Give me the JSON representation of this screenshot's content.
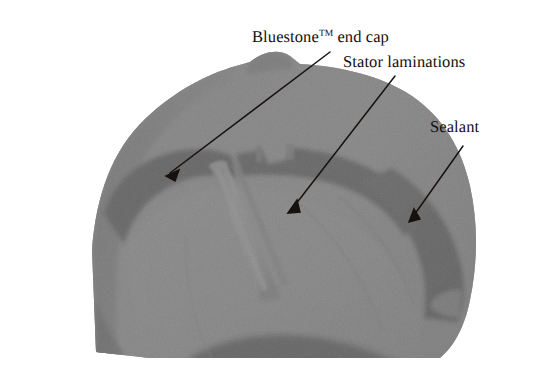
{
  "figure": {
    "kind": "annotated-photograph",
    "width": 541,
    "height": 377,
    "background_color": "#ffffff"
  },
  "annotations": {
    "bluestone": {
      "text_before": "Bluestone",
      "superscript": "TM",
      "text_after": " end cap",
      "full_text": "Bluestone™ end cap",
      "leader": {
        "x1": 330,
        "y1": 52,
        "x2": 166,
        "y2": 176,
        "arrow": "down-left"
      }
    },
    "stator": {
      "label": "Stator laminations",
      "leader": {
        "x1": 395,
        "y1": 76,
        "x2": 288,
        "y2": 213,
        "arrow": "down-left"
      }
    },
    "sealant": {
      "label": "Sealant",
      "leader": {
        "x1": 463,
        "y1": 146,
        "x2": 409,
        "y2": 222,
        "arrow": "down-left"
      }
    }
  },
  "palette": {
    "paper": "#ffffff",
    "ink": "#14100f",
    "housing_mid_gray": "#8c8c8c",
    "housing_light_gray": "#9b9b9b",
    "housing_shadow_gray": "#6f6f6f",
    "lamination_dark": "#2b2b2b",
    "sealant_dark": "#303030",
    "deep_shadow": "#1d1d1d",
    "rod_highlight": "#a6a6a6"
  },
  "regions": [
    {
      "name": "outer-housing-shell",
      "tone": "#8c8c8c",
      "description": "rounded motor housing shoulder occupying upper-left through center"
    },
    {
      "name": "upper-dark-lamination-band",
      "tone": "#2b2b2b",
      "description": "dark curved band of stator laminations across upper middle"
    },
    {
      "name": "cylindrical-rod",
      "tone": "#a6a6a6",
      "description": "light cylindrical pin running down-right through the center"
    },
    {
      "name": "lower-light-field",
      "tone": "#9b9b9b",
      "description": "large light gray rotor/stator face filling the lower middle"
    },
    {
      "name": "right-dark-sealant-mass",
      "tone": "#303030",
      "description": "dark sealant wedge on the right side"
    },
    {
      "name": "left-shadow-edge",
      "tone": "#6f6f6f",
      "description": "shaded left rim of the housing"
    },
    {
      "name": "bottom-dark-arc",
      "tone": "#1d1d1d",
      "description": "dark arc along the bottom of the cut section"
    }
  ]
}
